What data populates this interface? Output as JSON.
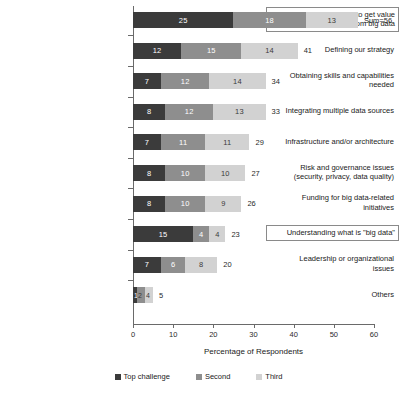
{
  "chart_data": {
    "type": "bar",
    "orientation": "horizontal",
    "stacked": true,
    "title": "",
    "xlabel": "Percentage of Respondents",
    "ylabel": "",
    "xlim": [
      0,
      60
    ],
    "xticks": [
      0,
      10,
      20,
      30,
      40,
      50,
      60
    ],
    "grid": false,
    "legend_position": "bottom",
    "legend": [
      "Top challenge",
      "Second",
      "Third"
    ],
    "series": [
      {
        "name": "Top challenge",
        "color": "#3b3b3b",
        "values": [
          25,
          12,
          7,
          8,
          7,
          8,
          8,
          15,
          7,
          1
        ]
      },
      {
        "name": "Second",
        "color": "#8e8e8e",
        "values": [
          18,
          15,
          12,
          12,
          11,
          10,
          10,
          4,
          6,
          2
        ]
      },
      {
        "name": "Third",
        "color": "#d2d2d2",
        "values": [
          13,
          14,
          14,
          13,
          11,
          10,
          9,
          4,
          8,
          2
        ]
      }
    ],
    "categories": [
      "Determining how to get value from big data",
      "Defining our strategy",
      "Obtaining skills and capabilities needed",
      "Integrating multiple data sources",
      "Infrastructure and/or architecture",
      "Risk and governance issues (security, privacy, data quality)",
      "Funding for big data-related initiatives",
      "Understanding what is \"big data\"",
      "Leadership or organizational issues",
      "Others"
    ],
    "totals": [
      "Sum=56",
      "41",
      "34",
      "33",
      "29",
      "27",
      "26",
      "23",
      "20",
      "5"
    ],
    "rows": [
      {
        "label_lines": [
          "Determining how to get value",
          "from big data"
        ],
        "highlighted": true,
        "seg_labels": [
          "25",
          "18",
          "13"
        ],
        "values": [
          25,
          18,
          13
        ],
        "total": "Sum=56"
      },
      {
        "label_lines": [
          "Defining our strategy"
        ],
        "highlighted": false,
        "seg_labels": [
          "12",
          "15",
          "14"
        ],
        "values": [
          12,
          15,
          14
        ],
        "total": "41"
      },
      {
        "label_lines": [
          "Obtaining skills and capabilities",
          "needed"
        ],
        "highlighted": false,
        "seg_labels": [
          "7",
          "12",
          "14"
        ],
        "values": [
          7,
          12,
          14
        ],
        "total": "34"
      },
      {
        "label_lines": [
          "Integrating multiple data sources"
        ],
        "highlighted": false,
        "seg_labels": [
          "8",
          "12",
          "13"
        ],
        "values": [
          8,
          12,
          13
        ],
        "total": "33"
      },
      {
        "label_lines": [
          "Infrastructure and/or architecture"
        ],
        "highlighted": false,
        "seg_labels": [
          "7",
          "11",
          "11"
        ],
        "values": [
          7,
          11,
          11
        ],
        "total": "29"
      },
      {
        "label_lines": [
          "Risk and governance issues",
          "(security, privacy, data quality)"
        ],
        "highlighted": false,
        "seg_labels": [
          "8",
          "10",
          "10"
        ],
        "values": [
          8,
          10,
          10
        ],
        "total": "27"
      },
      {
        "label_lines": [
          "Funding for big data-related",
          "initiatives"
        ],
        "highlighted": false,
        "seg_labels": [
          "8",
          "10",
          "9"
        ],
        "values": [
          8,
          10,
          9
        ],
        "total": "26"
      },
      {
        "label_lines": [
          "Understanding what is \"big data\""
        ],
        "highlighted": true,
        "seg_labels": [
          "15",
          "4",
          "4"
        ],
        "values": [
          15,
          4,
          4
        ],
        "total": "23"
      },
      {
        "label_lines": [
          "Leadership or organizational",
          "issues"
        ],
        "highlighted": false,
        "seg_labels": [
          "7",
          "6",
          "8"
        ],
        "values": [
          7,
          6,
          8
        ],
        "total": "20"
      },
      {
        "label_lines": [
          "Others"
        ],
        "highlighted": false,
        "seg_labels": [
          "1",
          "2",
          "4"
        ],
        "values": [
          1,
          2,
          2
        ],
        "total": "5"
      }
    ]
  },
  "colors": {
    "top_challenge": "#3b3b3b",
    "second": "#8e8e8e",
    "third": "#d2d2d2",
    "axis": "#6a6a6a",
    "highlight_border": "#8a8a8a"
  }
}
